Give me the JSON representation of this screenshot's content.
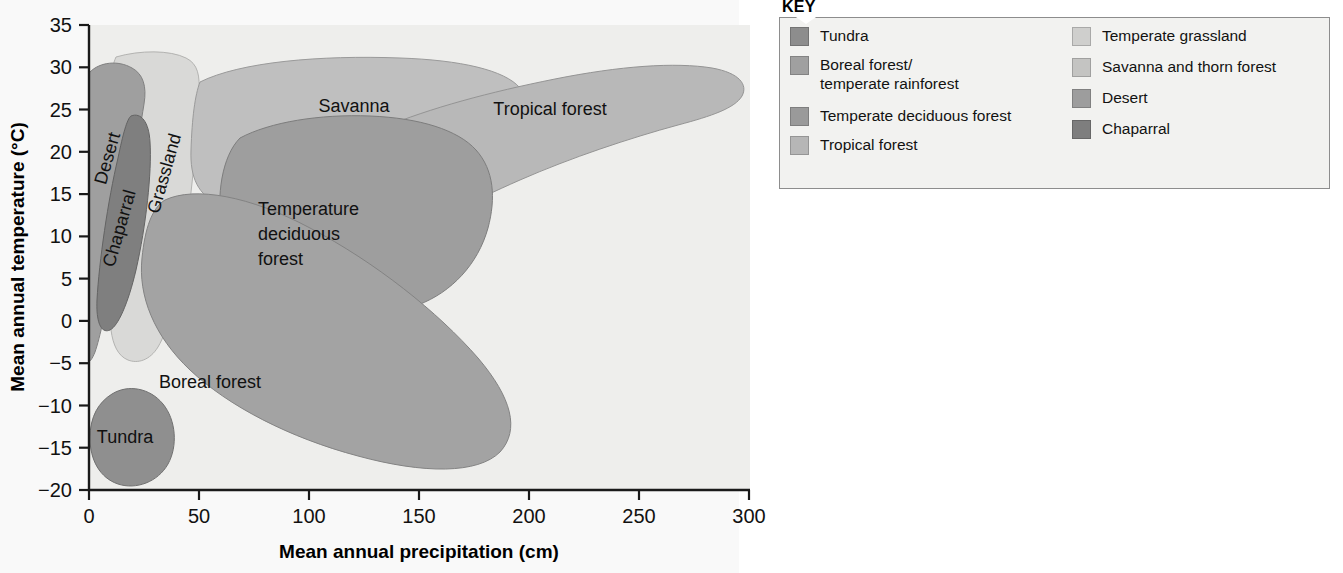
{
  "chart_data": {
    "type": "area",
    "title": "",
    "xlabel": "Mean annual precipitation (cm)",
    "ylabel": "Mean annual temperature (°C)",
    "xlim": [
      0,
      320
    ],
    "ylim": [
      -20,
      35
    ],
    "xticks": [
      0,
      50,
      100,
      150,
      200,
      250,
      300
    ],
    "xticklabels": [
      "0",
      "50",
      "100",
      "150",
      "200",
      "250",
      "300"
    ],
    "yticks": [
      -20,
      -15,
      -10,
      -5,
      0,
      5,
      10,
      15,
      20,
      25,
      30,
      35
    ],
    "yticklabels": [
      "−20",
      "−15",
      "−10",
      "−5",
      "0",
      "5",
      "10",
      "15",
      "20",
      "25",
      "30",
      "35"
    ],
    "grid": false,
    "legend_position": "right",
    "regions": [
      {
        "name": "Tundra",
        "label": "Tundra",
        "color": "#8d8d8d",
        "label_x": 13,
        "label_y": -13.0,
        "label_rotation": 0,
        "approx_precip_range": [
          0,
          42
        ],
        "approx_temp_range": [
          -19,
          -8
        ]
      },
      {
        "name": "Boreal forest/temperate rainforest",
        "label": "Boreal forest",
        "color": "#a0a0a0",
        "label_x": 67,
        "label_y": -6.5,
        "label_rotation": 0,
        "approx_precip_range": [
          10,
          200
        ],
        "approx_temp_range": [
          -18,
          12
        ]
      },
      {
        "name": "Temperate deciduous forest",
        "label": "Temperature\ndeciduous\nforest",
        "color": "#9a9a9a",
        "label_x": 93,
        "label_y": 14.0,
        "label_rotation": 0,
        "approx_precip_range": [
          58,
          168
        ],
        "approx_temp_range": [
          0,
          21
        ]
      },
      {
        "name": "Tropical forest",
        "label": "Tropical forest",
        "color": "#b6b6b6",
        "label_x": 228,
        "label_y": 25.0,
        "label_rotation": 0,
        "approx_precip_range": [
          118,
          312
        ],
        "approx_temp_range": [
          14,
          31
        ]
      },
      {
        "name": "Temperate grassland",
        "label": "Grassland",
        "color": "#d7d7d5",
        "label_x": 36,
        "label_y": 17.0,
        "label_rotation": -74,
        "approx_precip_range": [
          13,
          78
        ],
        "approx_temp_range": [
          -5,
          29
        ]
      },
      {
        "name": "Savanna and thorn forest",
        "label": "Savanna",
        "color": "#bcbcbc",
        "label_x": 120,
        "label_y": 25.5,
        "label_rotation": 0,
        "approx_precip_range": [
          44,
          230
        ],
        "approx_temp_range": [
          16,
          30
        ]
      },
      {
        "name": "Desert",
        "label": "Desert",
        "color": "#9d9d9d",
        "label_x": 8,
        "label_y": 24.0,
        "label_rotation": -74,
        "approx_precip_range": [
          0,
          30
        ],
        "approx_temp_range": [
          -3,
          30
        ]
      },
      {
        "name": "Chaparral",
        "label": "Chaparral",
        "color": "#7e7e7e",
        "label_x": 14,
        "label_y": 12.0,
        "label_rotation": -74,
        "approx_precip_range": [
          5,
          28
        ],
        "approx_temp_range": [
          0,
          23
        ]
      }
    ]
  },
  "legend": {
    "title": "KEY",
    "left_items": [
      {
        "label": "Tundra",
        "color": "#8d8d8d"
      },
      {
        "label": "Boreal forest/\ntemperate rainforest",
        "color": "#a0a0a0"
      },
      {
        "label": "Temperate deciduous forest",
        "color": "#9a9a9a"
      },
      {
        "label": "Tropical forest",
        "color": "#b6b6b6"
      }
    ],
    "right_items": [
      {
        "label": "Temperate grassland",
        "color": "#cfcfcd"
      },
      {
        "label": "Savanna and thorn forest",
        "color": "#c4c4c2"
      },
      {
        "label": "Desert",
        "color": "#9d9d9d"
      },
      {
        "label": "Chaparral",
        "color": "#7e7e7e"
      }
    ]
  },
  "axes": {
    "x_title": "Mean annual precipitation (cm)",
    "y_title": "Mean annual temperature (°C)"
  }
}
